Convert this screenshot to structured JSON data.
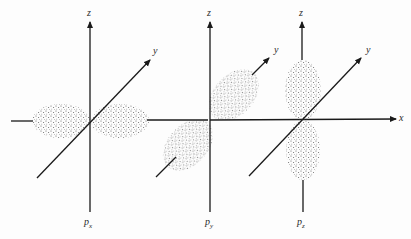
{
  "figure": {
    "panels": [
      {
        "name": "px",
        "axis_labels": {
          "z": "z",
          "y": "y"
        },
        "orbital_label": {
          "base": "p",
          "sub": "x"
        }
      },
      {
        "name": "py",
        "axis_labels": {
          "z": "z",
          "y": "y"
        },
        "orbital_label": {
          "base": "p",
          "sub": "y"
        }
      },
      {
        "name": "pz",
        "axis_labels": {
          "z": "z",
          "y": "y",
          "x": "x"
        },
        "orbital_label": {
          "base": "p",
          "sub": "z"
        }
      }
    ],
    "colors": {
      "axis": "#1a1a1a",
      "dots": "#555555",
      "background": "#fdfdfd"
    }
  }
}
